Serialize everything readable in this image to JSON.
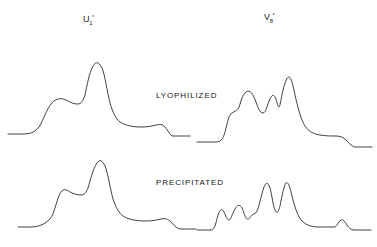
{
  "figure": {
    "background_color": "#ffffff",
    "trace_color": "#2a2a2a",
    "width": 377,
    "height": 247
  },
  "column_labels": [
    {
      "id": "u1",
      "base": "U",
      "subscript": "1",
      "prime": "'",
      "text": "U₁'"
    },
    {
      "id": "v8",
      "base": "V",
      "subscript": "8",
      "prime": "'",
      "text": "V₈'"
    }
  ],
  "row_labels": [
    {
      "id": "lyophilized",
      "text": "LYOPHILIZED"
    },
    {
      "id": "precipitated",
      "text": "PRECIPITATED"
    }
  ],
  "chart_data": {
    "type": "line",
    "title": "",
    "xlabel": "",
    "ylabel": "",
    "grid": false,
    "legend": "none",
    "panels": [
      {
        "id": "lyophilized-u1",
        "column": "U₁'",
        "row": "LYOPHILIZED",
        "peaks": [
          {
            "label": "shoulder",
            "x": 42,
            "height": 0.46
          },
          {
            "label": "main",
            "x": 93,
            "height": 1.0
          },
          {
            "label": "tail-step",
            "x": 150,
            "height": 0.12
          }
        ],
        "path": "M 8,134 L 22,134 C 30,134 34,133 39,127 C 44,119 48,105 54,101 C 60,97 64,99 68,101 C 72,103 74,104 78,104 C 81,104 83,101 85,95 C 87,86 89,73 93,66 C 96,61 99,62 102,68 C 105,75 107,91 110,103 C 113,113 116,119 120,122 C 126,126 134,127 142,127 C 148,127 152,126 156,125 C 160,124 162,124 165,127 C 168,130 169,134 172,136 L 190,136"
      },
      {
        "id": "lyophilized-v8",
        "column": "V₈'",
        "row": "LYOPHILIZED",
        "peaks": [
          {
            "label": "shoulder-low",
            "x": 228,
            "height": 0.34
          },
          {
            "label": "shoulder-high",
            "x": 241,
            "height": 0.52
          },
          {
            "label": "doublet-left",
            "x": 271,
            "height": 0.76
          },
          {
            "label": "main",
            "x": 281,
            "height": 1.0
          },
          {
            "label": "tail-step",
            "x": 330,
            "height": 0.16
          }
        ],
        "path": "M 197,142 L 216,142 C 222,142 224,137 226,128 C 228,120 229,115 232,113 C 235,111 237,111 239,107 C 241,102 242,95 246,92 C 250,89 253,94 256,102 C 258,108 260,113 263,113 C 266,113 267,105 270,99 C 272,94 274,94 276,99 C 277,103 278,107 279,107 C 280,107 281,99 283,90 C 285,82 287,77 289,77 C 291,77 293,85 295,95 C 298,108 301,120 305,126 C 309,132 314,134 320,135 C 326,136 331,136 336,136 C 340,136 343,137 346,140 C 349,143 351,146 355,147 L 372,147"
      },
      {
        "id": "precipitated-u1",
        "column": "U₁'",
        "row": "PRECIPITATED",
        "peaks": [
          {
            "label": "shoulder",
            "x": 55,
            "height": 0.44
          },
          {
            "label": "main",
            "x": 97,
            "height": 1.0
          },
          {
            "label": "tail-step",
            "x": 155,
            "height": 0.1
          }
        ],
        "path": "M 18,227 L 30,227 C 38,227 44,225 50,219 C 55,213 57,197 61,192 C 64,188 67,190 70,192 C 74,194 77,195 81,195 C 84,195 86,193 88,188 C 90,181 93,169 97,163 C 100,159 102,160 105,166 C 108,173 110,188 113,199 C 116,208 119,213 123,216 C 129,220 138,221 146,221 C 152,221 157,220 161,219 C 165,218 168,219 171,222 C 174,225 176,228 180,229 L 196,229"
      },
      {
        "id": "precipitated-v8",
        "column": "V₈'",
        "row": "PRECIPITATED",
        "peaks": [
          {
            "label": "bump-1",
            "x": 217,
            "height": 0.3
          },
          {
            "label": "bump-2",
            "x": 236,
            "height": 0.4
          },
          {
            "label": "doublet-left",
            "x": 265,
            "height": 0.84
          },
          {
            "label": "doublet-right",
            "x": 284,
            "height": 1.0
          },
          {
            "label": "tail-bump",
            "x": 340,
            "height": 0.14
          }
        ],
        "path": "M 197,230 L 211,230 C 215,230 216,222 218,215 C 220,209 222,208 224,212 C 226,216 227,220 229,220 C 231,220 232,214 235,209 C 237,205 240,204 242,208 C 244,212 245,218 247,219 C 249,220 250,217 252,215 C 254,213 256,214 257,211 C 259,207 261,196 264,187 C 266,182 268,182 270,188 C 272,195 273,206 275,210 C 277,214 278,213 280,206 C 282,196 284,185 286,183 C 288,181 290,187 292,196 C 295,208 298,217 302,221 C 307,226 313,227 320,227 C 326,227 330,227 334,227 C 337,227 338,222 341,220 C 343,219 345,222 347,225 C 349,228 351,230 354,230 L 371,230"
      }
    ]
  }
}
